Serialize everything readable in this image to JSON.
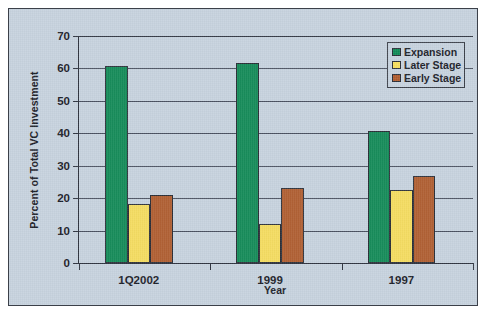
{
  "chart_data": {
    "type": "bar",
    "title": "",
    "xlabel": "Year",
    "ylabel": "Percent of Total VC Investment",
    "categories": [
      "1Q2002",
      "1999",
      "1997"
    ],
    "series": [
      {
        "name": "Expansion",
        "color": "#0f8a56",
        "values": [
          60.9,
          61.6,
          40.6
        ]
      },
      {
        "name": "Later Stage",
        "color": "#f7de5d",
        "values": [
          18.2,
          12.1,
          22.5
        ]
      },
      {
        "name": "Early Stage",
        "color": "#b05c2e",
        "values": [
          20.9,
          23.0,
          26.7
        ]
      }
    ],
    "ylim": [
      0,
      70
    ],
    "yticks": [
      0,
      10,
      20,
      30,
      40,
      50,
      60,
      70
    ],
    "ytick_labels": [
      "0",
      "10",
      "20",
      "30",
      "40",
      "50",
      "60",
      "70"
    ],
    "grid": "horizontal",
    "legend_position": "top-right",
    "background_color": "#c6d2de",
    "axis_color": "#2f3440",
    "gridline_color": "#4a5160",
    "border_color": "#3b4049"
  }
}
